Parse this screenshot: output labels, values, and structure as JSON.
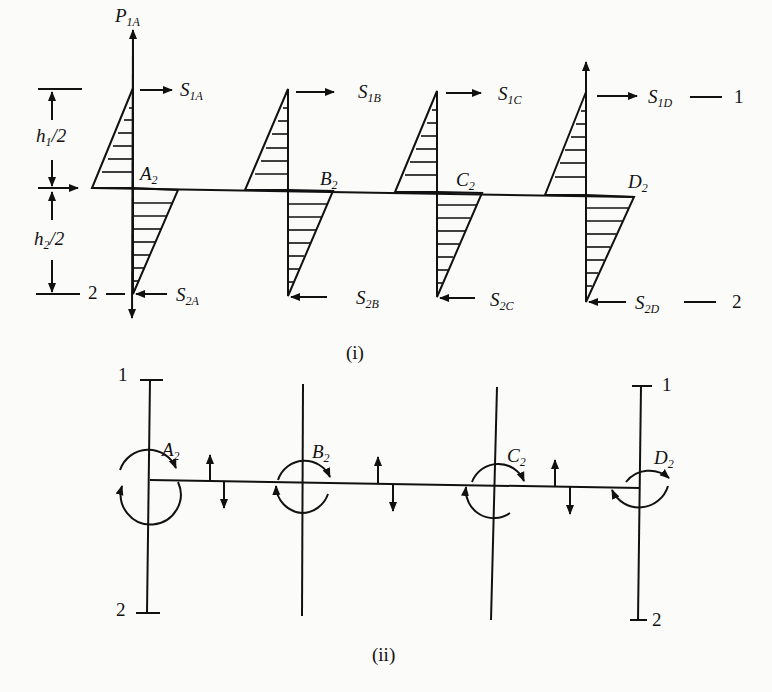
{
  "figure": {
    "part_i": {
      "caption": "(i)",
      "top_load": {
        "sym": "P",
        "sub": "1A"
      },
      "dims": [
        {
          "sym": "h",
          "sub": "1",
          "tail": "/2"
        },
        {
          "sym": "h",
          "sub": "2",
          "tail": "/2"
        }
      ],
      "joints": [
        {
          "sym": "A",
          "sub": "2",
          "top_shear": {
            "sym": "S",
            "sub": "1A"
          },
          "bottom_shear": {
            "sym": "S",
            "sub": "2A"
          }
        },
        {
          "sym": "B",
          "sub": "2",
          "top_shear": {
            "sym": "S",
            "sub": "1B"
          },
          "bottom_shear": {
            "sym": "S",
            "sub": "2B"
          }
        },
        {
          "sym": "C",
          "sub": "2",
          "top_shear": {
            "sym": "S",
            "sub": "1C"
          },
          "bottom_shear": {
            "sym": "S",
            "sub": "2C"
          }
        },
        {
          "sym": "D",
          "sub": "2",
          "top_shear": {
            "sym": "S",
            "sub": "1D"
          },
          "bottom_shear": {
            "sym": "S",
            "sub": "2D"
          }
        }
      ],
      "level_labels": {
        "top_right": "1",
        "bottom_left": "2",
        "bottom_right": "2"
      }
    },
    "part_ii": {
      "caption": "(ii)",
      "joints": [
        {
          "sym": "A",
          "sub": "2"
        },
        {
          "sym": "B",
          "sub": "2"
        },
        {
          "sym": "C",
          "sub": "2"
        },
        {
          "sym": "D",
          "sub": "2"
        }
      ],
      "level_labels": {
        "left_top": "1",
        "left_bottom": "2",
        "right_top": "1",
        "right_bottom": "2"
      }
    }
  }
}
